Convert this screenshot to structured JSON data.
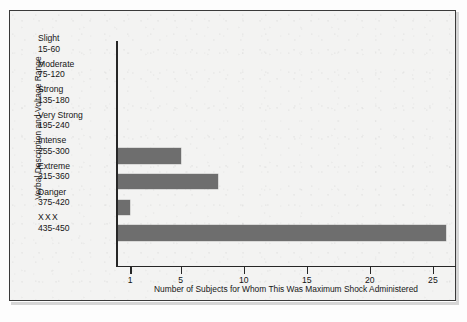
{
  "chart_data": {
    "type": "bar",
    "orientation": "horizontal",
    "title": "",
    "xlabel": "Number of Subjects for Whom This Was Maximum Shock Administered",
    "ylabel": "Verbal Description and Voltage Range",
    "grid": false,
    "legend": null,
    "xlim": [
      0,
      26.8
    ],
    "xticks": [
      1,
      5,
      10,
      15,
      20,
      25
    ],
    "xtick_labels": [
      "1",
      "5",
      "10",
      "15",
      "20",
      "25"
    ],
    "bar_color": "#6e6e6e",
    "axis_color": "#262626",
    "categories": [
      "Slight 15-60",
      "Moderate 75-120",
      "Strong 135-180",
      "Very Strong 195-240",
      "Intense 255-300",
      "Extreme 315-360",
      "Danger 375-420",
      "XXX 435-450"
    ],
    "category_names": [
      "Slight",
      "Moderate",
      "Strong",
      "Very Strong",
      "Intense",
      "Extreme",
      "Danger",
      "XXX"
    ],
    "category_ranges": [
      "15-60",
      "75-120",
      "135-180",
      "195-240",
      "255-300",
      "315-360",
      "375-420",
      "435-450"
    ],
    "values": [
      0,
      0,
      0,
      0,
      5,
      8,
      1,
      26
    ]
  },
  "figure": {
    "background": "#f3f3f2",
    "frame_color": "#3a3a3a"
  }
}
